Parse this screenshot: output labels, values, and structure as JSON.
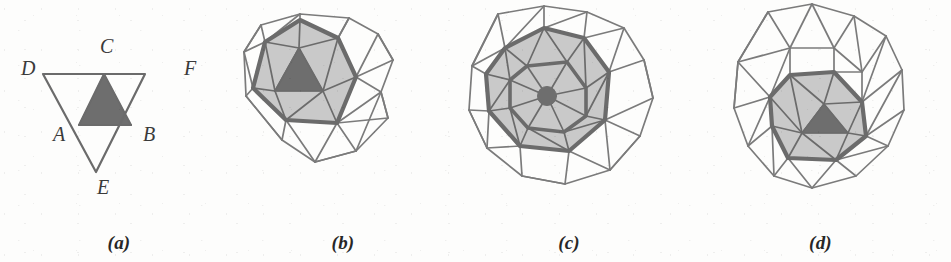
{
  "figure": {
    "background_color": "#fdfdfc",
    "panels": [
      {
        "id": "a",
        "caption": "(a)",
        "description": "Initial inverted triangle DEF with inscribed shaded triangle",
        "vertex_labels": [
          {
            "name": "C",
            "text": "C",
            "x": 100,
            "y": 38
          },
          {
            "name": "D",
            "text": "D",
            "x": 22,
            "y": 59
          },
          {
            "name": "F",
            "text": "F",
            "x": 183,
            "y": 59
          },
          {
            "name": "A",
            "text": "A",
            "x": 53,
            "y": 124
          },
          {
            "name": "B",
            "text": "B",
            "x": 143,
            "y": 124
          },
          {
            "name": "E",
            "text": "E",
            "x": 97,
            "y": 178
          }
        ]
      },
      {
        "id": "b",
        "caption": "(b)",
        "description": "First refinement: coarse triangular mesh with shaded front polygon and dark core triangle"
      },
      {
        "id": "c",
        "caption": "(c)",
        "description": "Second refinement: denser mesh, shaded annular front, dark central node"
      },
      {
        "id": "d",
        "caption": "(d)",
        "description": "Third refinement: mesh with shaded lower polygon and dark core triangle"
      }
    ],
    "colors": {
      "ink": "#6b6b6b",
      "ink_dark": "#5a5a5a",
      "fill_light": "#c9c9c9",
      "fill_dark": "#6e6e6e",
      "paper": "#fdfdfc",
      "label": "#3a3a3a"
    }
  }
}
